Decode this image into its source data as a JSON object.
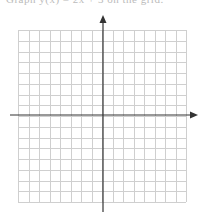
{
  "caption": {
    "text": "Graph y(x) = 2x + 3 on the grid."
  },
  "coordinate_plane": {
    "grid": {
      "left": 18,
      "top": 30,
      "right": 186,
      "bottom": 202,
      "columns": 16,
      "rows": 16,
      "line_color": "#cfcfcf"
    },
    "x_axis": {
      "y": 115,
      "x_start": 10,
      "x_end": 198,
      "arrow": "right",
      "color": "#333333"
    },
    "y_axis": {
      "x": 103,
      "y_start": 212,
      "y_end": 15,
      "arrow": "up",
      "color": "#333333"
    }
  },
  "chart_data": {
    "type": "grid",
    "title": "",
    "xlabel": "",
    "ylabel": "",
    "grid": true,
    "xlim": [
      -8,
      8
    ],
    "ylim": [
      -8,
      8
    ],
    "series": []
  }
}
